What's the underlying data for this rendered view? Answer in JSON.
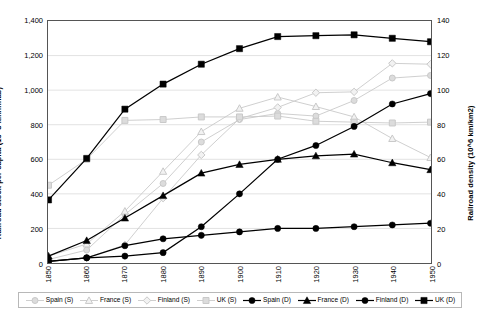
{
  "chart_data": {
    "type": "line",
    "title": "",
    "subtitle": "",
    "xlabel": "",
    "ylabel": "Railroad stock per capita  (10^3 km/inhab)",
    "y2label": "Railroad density  (10^6 km/km2)",
    "grid": true,
    "legend_position": "bottom",
    "x": [
      1850,
      1860,
      1870,
      1880,
      1890,
      1900,
      1910,
      1920,
      1930,
      1940,
      1950
    ],
    "xtick_labels": [
      "1850",
      "1860",
      "1870",
      "1880",
      "1890",
      "1900",
      "1910",
      "1920",
      "1930",
      "1940",
      "1950"
    ],
    "ylim": [
      0,
      1400
    ],
    "ytick_labels": [
      "0",
      "200",
      "400",
      "600",
      "800",
      "1,000",
      "1,200",
      "1,400"
    ],
    "ytick_values": [
      0,
      200,
      400,
      600,
      800,
      1000,
      1200,
      1400
    ],
    "y2lim": [
      0,
      140
    ],
    "y2tick_labels": [
      "0",
      "20",
      "40",
      "60",
      "80",
      "100",
      "120",
      "140"
    ],
    "y2tick_values": [
      0,
      20,
      40,
      60,
      80,
      100,
      120,
      140
    ],
    "series": [
      {
        "name": "Spain (S)",
        "axis": "left",
        "color": "#c9c9c9",
        "marker": "circle",
        "values": [
          20,
          75,
          280,
          460,
          700,
          830,
          865,
          850,
          940,
          1070,
          1085
        ]
      },
      {
        "name": "France (S)",
        "axis": "left",
        "color": "#c9c9c9",
        "marker": "triangle",
        "values": [
          40,
          110,
          300,
          530,
          760,
          895,
          960,
          905,
          845,
          720,
          610
        ]
      },
      {
        "name": "Finland (S)",
        "axis": "left",
        "color": "#c9c9c9",
        "marker": "diamond",
        "values": [
          10,
          30,
          105,
          375,
          625,
          835,
          900,
          985,
          990,
          1155,
          1150
        ]
      },
      {
        "name": "UK (S)",
        "axis": "left",
        "color": "#c9c9c9",
        "marker": "square",
        "values": [
          450,
          600,
          825,
          830,
          845,
          845,
          850,
          820,
          815,
          810,
          815
        ]
      },
      {
        "name": "Spain (D)",
        "axis": "right",
        "color": "#000000",
        "marker": "circle",
        "values": [
          1,
          3,
          4,
          6,
          21,
          40,
          60,
          68,
          79,
          92,
          98
        ]
      },
      {
        "name": "France (D)",
        "axis": "right",
        "color": "#000000",
        "marker": "triangle",
        "values": [
          4,
          13,
          26,
          39,
          52,
          57,
          60,
          62,
          63,
          58,
          54
        ]
      },
      {
        "name": "Finland (D)",
        "axis": "right",
        "color": "#000000",
        "marker": "circle",
        "values": [
          1,
          3,
          10,
          14,
          16,
          18,
          20,
          20,
          21,
          22,
          23
        ]
      },
      {
        "name": "UK (D)",
        "axis": "right",
        "color": "#000000",
        "marker": "square",
        "values": [
          36.5,
          60.5,
          89,
          103.5,
          115,
          124,
          131,
          131.5,
          132,
          130,
          128
        ]
      }
    ]
  }
}
